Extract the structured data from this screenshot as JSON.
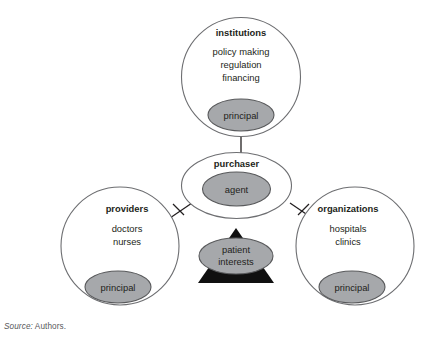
{
  "figure": {
    "background_color": "#ffffff",
    "outline_color": "#6d6e71",
    "inner_fill_color": "#a6a8ab",
    "triangle_color": "#101010",
    "text_color": "#231f20"
  },
  "nodes": {
    "institutions": {
      "title": "institutions",
      "lines": [
        "policy making",
        "regulation",
        "financing"
      ],
      "inner_label": "principal"
    },
    "purchaser": {
      "title": "purchaser",
      "lines": [],
      "inner_label": "agent"
    },
    "providers": {
      "title": "providers",
      "lines": [
        "doctors",
        "nurses"
      ],
      "inner_label": "principal"
    },
    "organizations": {
      "title": "organizations",
      "lines": [
        "hospitals",
        "clinics"
      ],
      "inner_label": "principal"
    },
    "center": {
      "line1": "patient",
      "line2": "interests"
    }
  },
  "source": {
    "label": "Source:",
    "value": "Authors."
  }
}
